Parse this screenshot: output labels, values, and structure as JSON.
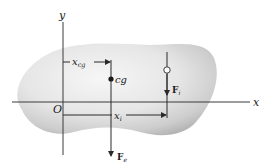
{
  "diagram": {
    "type": "center-of-gravity free body sketch",
    "axes": {
      "x_label": "x",
      "y_label": "y",
      "origin_label": "O"
    },
    "body": {
      "description": "irregular gray blob-shaped rigid body",
      "fill_light": "#f4f4f4",
      "fill_dark": "#b9b9b9"
    },
    "center_of_gravity": {
      "label": "cg",
      "dimension": {
        "base": "x",
        "subscript": "cg"
      },
      "force": {
        "base": "F",
        "subscript": "e"
      }
    },
    "element": {
      "dimension": {
        "base": "x",
        "subscript": "i"
      },
      "force": {
        "base": "F",
        "subscript": "i"
      }
    },
    "colors": {
      "line": "#2a2a2a",
      "text": "#1a1a1a",
      "background": "#ffffff"
    }
  }
}
